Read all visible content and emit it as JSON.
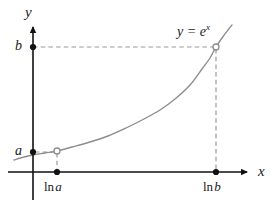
{
  "figure": {
    "background_color": "#ffffff",
    "axis_color": "#111111",
    "curve_color": "#8c8c8c",
    "dash_color": "#9a9a9a",
    "marker_fill_color": "#111111",
    "marker_open_color": "#8c8c8c"
  },
  "axes": {
    "y_axis_label": "y",
    "x_axis_label": "x",
    "origin_px": {
      "x": 33,
      "y": 172
    },
    "x_axis_span_px": {
      "from": 8,
      "to": 252
    },
    "y_axis_span_px": {
      "from": 22,
      "to": 200
    }
  },
  "y_ticks": [
    {
      "label": "b",
      "value_px_y": 47
    },
    {
      "label": "a",
      "value_px_y": 152
    }
  ],
  "x_ticks": [
    {
      "fn": "ln",
      "arg": "a",
      "value_px_x": 57
    },
    {
      "fn": "ln",
      "arg": "b",
      "value_px_x": 216
    }
  ],
  "curve": {
    "equation_base": "y = e",
    "equation_exponent": "x",
    "description": "exponential curve"
  },
  "chart_data": {
    "type": "line",
    "xlabel": "x",
    "ylabel": "y",
    "grid": false,
    "legend": "none",
    "xlim": [
      -0.35,
      1.7
    ],
    "ylim": [
      0,
      1.25
    ],
    "x_tick_labels": [
      "ln a",
      "ln b"
    ],
    "y_tick_labels": [
      "a",
      "b"
    ],
    "series": [
      {
        "name": "y = e^x",
        "color": "#8c8c8c",
        "points_px": [
          [
            14,
            160
          ],
          [
            24,
            157
          ],
          [
            33,
            155
          ],
          [
            45,
            153
          ],
          [
            57,
            151
          ],
          [
            72,
            147
          ],
          [
            90,
            142
          ],
          [
            108,
            136
          ],
          [
            126,
            128
          ],
          [
            144,
            119
          ],
          [
            160,
            110
          ],
          [
            175,
            99
          ],
          [
            190,
            85
          ],
          [
            202,
            69
          ],
          [
            210,
            58
          ],
          [
            216,
            47
          ],
          [
            222,
            38
          ],
          [
            228,
            30
          ],
          [
            232,
            25
          ]
        ]
      }
    ],
    "annotations": [
      {
        "text": "y = e^x",
        "position_px": {
          "x": 177,
          "y": 23
        }
      }
    ],
    "marked_points": [
      {
        "label": "(ln a, a)",
        "px": {
          "x": 57,
          "y": 151
        },
        "marker": "open-circle"
      },
      {
        "label": "(ln b, b)",
        "px": {
          "x": 216,
          "y": 47
        },
        "marker": "open-circle"
      }
    ],
    "guide_lines": [
      {
        "type": "horizontal",
        "from_px": [
          33,
          47
        ],
        "to_px": [
          216,
          47
        ],
        "style": "dashed"
      },
      {
        "type": "horizontal",
        "from_px": [
          33,
          152
        ],
        "to_px": [
          57,
          152
        ],
        "style": "dashed"
      },
      {
        "type": "vertical",
        "from_px": [
          216,
          47
        ],
        "to_px": [
          216,
          172
        ],
        "style": "dashed"
      },
      {
        "type": "vertical",
        "from_px": [
          57,
          152
        ],
        "to_px": [
          57,
          172
        ],
        "style": "dashed"
      }
    ]
  }
}
